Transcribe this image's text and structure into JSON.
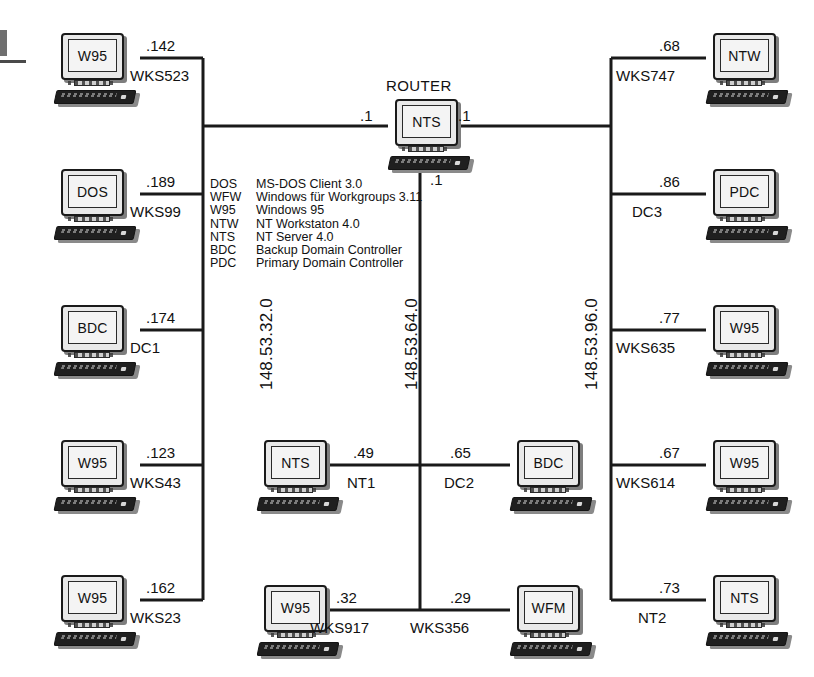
{
  "diagram": {
    "title": "ROUTER",
    "router": {
      "type": "NTS",
      "title": "ROUTER",
      "if_left": ".1",
      "if_right": ".1",
      "if_down": ".1"
    },
    "subnets": [
      {
        "id": "left",
        "label": "148.53.32.0"
      },
      {
        "id": "middle",
        "label": "148.53.64.0"
      },
      {
        "id": "right",
        "label": "148.53.96.0"
      }
    ],
    "legend": {
      "rows": [
        {
          "abbr": "DOS",
          "desc": "MS-DOS Client 3.0"
        },
        {
          "abbr": "WFW",
          "desc": "Windows für Workgroups 3.11"
        },
        {
          "abbr": "W95",
          "desc": "Windows 95"
        },
        {
          "abbr": "NTW",
          "desc": "NT Workstaton 4.0"
        },
        {
          "abbr": "NTS",
          "desc": "NT Server 4.0"
        },
        {
          "abbr": "BDC",
          "desc": "Backup Domain Controller"
        },
        {
          "abbr": "PDC",
          "desc": "Primary Domain Controller"
        }
      ]
    },
    "hosts": {
      "left": [
        {
          "os": "W95",
          "ip": ".142",
          "name": "WKS523"
        },
        {
          "os": "DOS",
          "ip": ".189",
          "name": "WKS99"
        },
        {
          "os": "BDC",
          "ip": ".174",
          "name": "DC1"
        },
        {
          "os": "W95",
          "ip": ".123",
          "name": "WKS43"
        },
        {
          "os": "W95",
          "ip": ".162",
          "name": "WKS23"
        }
      ],
      "middle": [
        {
          "os": "NTS",
          "ip": ".49",
          "name": "NT1"
        },
        {
          "os": "BDC",
          "ip": ".65",
          "name": "DC2"
        },
        {
          "os": "W95",
          "ip": ".32",
          "name": "WKS917"
        },
        {
          "os": "WFM",
          "ip": ".29",
          "name": "WKS356"
        }
      ],
      "right": [
        {
          "os": "NTW",
          "ip": ".68",
          "name": "WKS747"
        },
        {
          "os": "PDC",
          "ip": ".86",
          "name": "DC3"
        },
        {
          "os": "W95",
          "ip": ".77",
          "name": "WKS635"
        },
        {
          "os": "W95",
          "ip": ".67",
          "name": "WKS614"
        },
        {
          "os": "NTS",
          "ip": ".73",
          "name": "NT2"
        }
      ]
    },
    "colors": {
      "wire": "#1a1a1a",
      "background": "#ffffff",
      "screen": "#f4f4f4",
      "keyboard": "#1f1f1f"
    }
  }
}
